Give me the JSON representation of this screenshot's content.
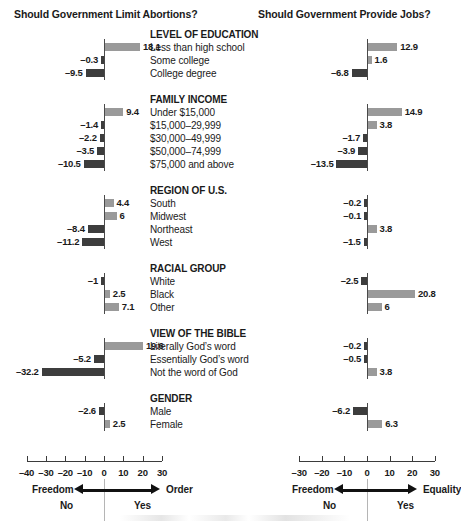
{
  "titles": {
    "left": "Should Government Limit Abortions?",
    "right": "Should Government Provide Jobs?"
  },
  "axes": {
    "left": {
      "ticks": [
        "–40",
        "–30",
        "–20",
        "–10",
        "0",
        "10",
        "20",
        "30"
      ],
      "min": -40,
      "max": 30,
      "pole_left": "Freedom",
      "pole_right": "Order",
      "answer_left": "No",
      "answer_right": "Yes"
    },
    "right": {
      "ticks": [
        "–30",
        "–20",
        "–10",
        "0",
        "10",
        "20",
        "30"
      ],
      "min": -30,
      "max": 30,
      "pole_left": "Freedom",
      "pole_right": "Equality",
      "answer_left": "No",
      "answer_right": "Yes"
    }
  },
  "colors": {
    "positive_bar": "#9a9a9a",
    "negative_bar": "#3d3d3d",
    "axis": "#3b3b3b",
    "zero_line": "#4a4a4a",
    "text": "#1a1a1a"
  },
  "chart_data": {
    "type": "bar",
    "xlabel": "",
    "ylabel": "",
    "orientation": "horizontal",
    "grid": false,
    "legend": "none",
    "panels": [
      {
        "name": "abortions",
        "title": "Should Government Limit Abortions?",
        "xlim": [
          -40,
          30
        ],
        "xticks": [
          -40,
          -30,
          -20,
          -10,
          0,
          10,
          20,
          30
        ],
        "axis_left_pole": "Freedom",
        "axis_right_pole": "Order",
        "answer_left": "No",
        "answer_right": "Yes"
      },
      {
        "name": "jobs",
        "title": "Should Government Provide Jobs?",
        "xlim": [
          -30,
          30
        ],
        "xticks": [
          -30,
          -20,
          -10,
          0,
          10,
          20,
          30
        ],
        "axis_left_pole": "Freedom",
        "axis_right_pole": "Equality",
        "answer_left": "No",
        "answer_right": "Yes"
      }
    ],
    "groups": [
      {
        "heading": "LEVEL OF EDUCATION",
        "categories": [
          "Less than high school",
          "Some college",
          "College degree"
        ],
        "abortions": [
          18.1,
          -0.3,
          -9.5
        ],
        "jobs": [
          12.9,
          1.6,
          -6.8
        ],
        "abortions_labels": [
          "18.1",
          "–0.3",
          "–9.5"
        ],
        "jobs_labels": [
          "12.9",
          "1.6",
          "–6.8"
        ]
      },
      {
        "heading": "FAMILY INCOME",
        "categories": [
          "Under $15,000",
          "$15,000–29,999",
          "$30,000–49,999",
          "$50,000–74,999",
          "$75,000 and above"
        ],
        "abortions": [
          9.4,
          -1.4,
          -2.2,
          -3.5,
          -10.5
        ],
        "jobs": [
          14.9,
          3.8,
          -1.7,
          -3.9,
          -13.5
        ],
        "abortions_labels": [
          "9.4",
          "–1.4",
          "–2.2",
          "–3.5",
          "–10.5"
        ],
        "jobs_labels": [
          "14.9",
          "3.8",
          "–1.7",
          "–3.9",
          "–13.5"
        ]
      },
      {
        "heading": "REGION OF U.S.",
        "categories": [
          "South",
          "Midwest",
          "Northeast",
          "West"
        ],
        "abortions": [
          4.4,
          6,
          -8.4,
          -11.2
        ],
        "jobs": [
          -0.2,
          -0.1,
          3.8,
          -1.5
        ],
        "abortions_labels": [
          "4.4",
          "6",
          "–8.4",
          "–11.2"
        ],
        "jobs_labels": [
          "–0.2",
          "–0.1",
          "3.8",
          "–1.5"
        ]
      },
      {
        "heading": "RACIAL GROUP",
        "categories": [
          "White",
          "Black",
          "Other"
        ],
        "abortions": [
          -1,
          2.5,
          7.1
        ],
        "jobs": [
          -2.5,
          20.8,
          6
        ],
        "abortions_labels": [
          "–1",
          "2.5",
          "7.1"
        ],
        "jobs_labels": [
          "–2.5",
          "20.8",
          "6"
        ]
      },
      {
        "heading": "VIEW OF THE BIBLE",
        "categories": [
          "Literally God’s word",
          "Essentially God’s word",
          "Not the word of God"
        ],
        "abortions": [
          19.6,
          -5.2,
          -32.2
        ],
        "jobs": [
          -0.2,
          -0.5,
          3.8
        ],
        "abortions_labels": [
          "19.6",
          "–5.2",
          "–32.2"
        ],
        "jobs_labels": [
          "–0.2",
          "–0.5",
          "3.8"
        ]
      },
      {
        "heading": "GENDER",
        "categories": [
          "Male",
          "Female"
        ],
        "abortions": [
          -2.6,
          2.5
        ],
        "jobs": [
          -6.2,
          6.3
        ],
        "abortions_labels": [
          "–2.6",
          "2.5"
        ],
        "jobs_labels": [
          "–6.2",
          "6.3"
        ],
        "order_note": "rows rendered top-to-bottom: Male, Female"
      }
    ]
  }
}
